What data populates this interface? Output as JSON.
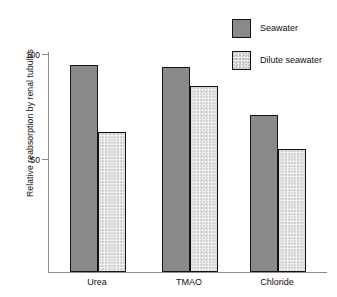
{
  "chart_data": {
    "type": "bar",
    "title": "",
    "xlabel": "",
    "ylabel": "Relative reabsorption by renal tubules",
    "categories": [
      "Urea",
      "TMAO",
      "Chloride"
    ],
    "ylim": [
      0,
      100
    ],
    "yticks": [
      50,
      100
    ],
    "ytick_labels": [
      "50",
      "100"
    ],
    "grid": false,
    "legend_position": "top-right",
    "series": [
      {
        "name": "Seawater",
        "color": "#8a8a8a",
        "values": [
          95,
          94,
          71
        ]
      },
      {
        "name": "Dilute seawater",
        "color": "#f0f0f0",
        "values": [
          63,
          85,
          55
        ]
      }
    ]
  },
  "legend": {
    "items": [
      {
        "label": "Seawater",
        "swatch": "seawater-swatch"
      },
      {
        "label": "Dilute seawater",
        "swatch": "dilute-seawater-swatch"
      }
    ]
  },
  "axes": {
    "y_title": "Relative reabsorption by renal tubules",
    "y_tick_top": "100",
    "y_tick_mid": "50"
  },
  "x_labels": {
    "cat0": "Urea",
    "cat1": "TMAO",
    "cat2": "Chloride"
  }
}
